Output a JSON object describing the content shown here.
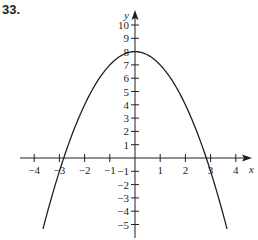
{
  "problem_label": "33.",
  "chart_data": {
    "type": "line",
    "title": "",
    "xlabel": "x",
    "ylabel": "y",
    "function": "y = 8 - x^2",
    "xlim": [
      -4.2,
      4.5
    ],
    "ylim": [
      -6,
      11
    ],
    "x_ticks": [
      -4,
      -3,
      -2,
      -1,
      1,
      2,
      3,
      4
    ],
    "x_tick_labels": [
      "−4",
      "−3",
      "−2",
      "−1",
      "1",
      "2",
      "3",
      "4"
    ],
    "y_ticks": [
      -5,
      -4,
      -3,
      -2,
      -1,
      1,
      2,
      3,
      4,
      5,
      6,
      7,
      8,
      9,
      10
    ],
    "y_tick_labels": [
      "−5",
      "−4",
      "−3",
      "−2",
      "−1",
      "1",
      "2",
      "3",
      "4",
      "5",
      "6",
      "7",
      "8",
      "9",
      "10"
    ],
    "grid": false,
    "series": [
      {
        "name": "parabola",
        "x_range": [
          -3.65,
          3.65
        ],
        "vertex": [
          0,
          8
        ],
        "x_intercepts": [
          -2.83,
          2.83
        ],
        "color": "#231f20"
      }
    ]
  }
}
